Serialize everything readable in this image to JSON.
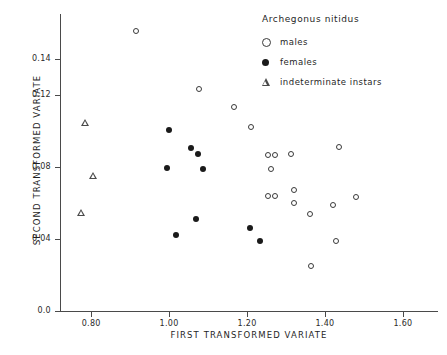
{
  "chart_data": {
    "type": "scatter",
    "title": "",
    "xlabel": "FIRST TRANSFORMED VARIATE",
    "ylabel": "SECOND TRANSFORMED VARIATE",
    "xlim": [
      0.72,
      1.69
    ],
    "ylim": [
      0.0,
      0.165
    ],
    "xticks": [
      0.8,
      1.0,
      1.2,
      1.4,
      1.6
    ],
    "xticklabels": [
      "0.80",
      "1.00",
      "1.20",
      "1.40",
      "1.60"
    ],
    "yticks": [
      0.0,
      0.04,
      0.08,
      0.12,
      0.14
    ],
    "yticklabels": [
      "0.0",
      "0.04",
      "0.08",
      "0.12",
      "0.14"
    ],
    "grid": false,
    "legend_position": "top-right",
    "legend_title": "Archegonus nitidus",
    "series": [
      {
        "name": "males",
        "marker": "open-circle",
        "color": "#3a3a3a",
        "points": [
          [
            0.915,
            0.1555
          ],
          [
            1.076,
            0.1235
          ],
          [
            1.166,
            0.1135
          ],
          [
            1.21,
            0.1025
          ],
          [
            1.253,
            0.0865
          ],
          [
            1.271,
            0.0865
          ],
          [
            1.314,
            0.087
          ],
          [
            1.436,
            0.091
          ],
          [
            1.262,
            0.079
          ],
          [
            1.255,
            0.064
          ],
          [
            1.273,
            0.064
          ],
          [
            1.32,
            0.067
          ],
          [
            1.32,
            0.06
          ],
          [
            1.42,
            0.059
          ],
          [
            1.48,
            0.0635
          ],
          [
            1.362,
            0.054
          ],
          [
            1.428,
            0.039
          ],
          [
            1.365,
            0.025
          ]
        ]
      },
      {
        "name": "females",
        "marker": "filled-circle",
        "color": "#1a1a1a",
        "points": [
          [
            1.0,
            0.1005
          ],
          [
            1.057,
            0.0905
          ],
          [
            1.075,
            0.087
          ],
          [
            0.995,
            0.0795
          ],
          [
            1.086,
            0.079
          ],
          [
            1.07,
            0.051
          ],
          [
            1.018,
            0.042
          ],
          [
            1.208,
            0.046
          ],
          [
            1.233,
            0.039
          ]
        ]
      },
      {
        "name": "indeterminate instars",
        "marker": "open-triangle",
        "color": "#4a4a4a",
        "points": [
          [
            0.785,
            0.105
          ],
          [
            0.805,
            0.0755
          ],
          [
            0.775,
            0.055
          ]
        ]
      }
    ]
  },
  "axes": {
    "x_title": "FIRST TRANSFORMED VARIATE",
    "y_title": "SECOND TRANSFORMED VARIATE",
    "x_tick_labels": [
      "0.80",
      "1.00",
      "1.20",
      "1.40",
      "1.60"
    ],
    "y_tick_labels": [
      "0.0",
      "0.04",
      "0.08",
      "0.12",
      "0.14"
    ]
  },
  "legend": {
    "title": "Archegonus nitidus",
    "entries": [
      {
        "label": "males",
        "marker": "open-circle"
      },
      {
        "label": "females",
        "marker": "filled-circle"
      },
      {
        "label": "indeterminate instars",
        "marker": "open-triangle"
      }
    ]
  }
}
